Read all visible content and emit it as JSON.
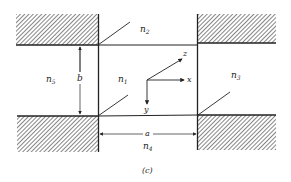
{
  "figure": {
    "caption": "(c)",
    "regions": {
      "n1": {
        "base": "n",
        "sub": "1"
      },
      "n2": {
        "base": "n",
        "sub": "2"
      },
      "n3": {
        "base": "n",
        "sub": "3"
      },
      "n4": {
        "base": "n",
        "sub": "4"
      },
      "n5": {
        "base": "n",
        "sub": "5"
      }
    },
    "dimensions": {
      "width_label": "a",
      "height_label": "b"
    },
    "axes": {
      "x": "x",
      "y": "y",
      "z": "z"
    },
    "colors": {
      "line": "#222222",
      "hatch": "#333333",
      "background": "#ffffff"
    }
  }
}
